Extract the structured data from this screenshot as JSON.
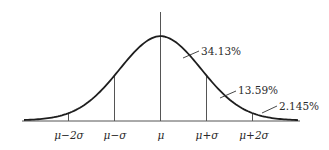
{
  "chart_data": {
    "type": "line",
    "title": "",
    "xlabel": "",
    "ylabel": "",
    "grid": false,
    "tick_labels": [
      "μ−2σ",
      "μ−σ",
      "μ",
      "μ+σ",
      "μ+2σ"
    ],
    "tick_positions_sigma": [
      -2,
      -1,
      0,
      1,
      2
    ],
    "annotations": [
      {
        "text": "34.13%",
        "region": "μ to μ+σ"
      },
      {
        "text": "13.59%",
        "region": "μ+σ to μ+2σ"
      },
      {
        "text": "2.145%",
        "region": "beyond μ+2σ"
      }
    ],
    "series": [
      {
        "name": "normal density",
        "x_sigma": [
          -3,
          -2.5,
          -2,
          -1.5,
          -1,
          -0.5,
          0,
          0.5,
          1,
          1.5,
          2,
          2.5,
          3
        ],
        "y_relative": [
          0.04,
          0.08,
          0.15,
          0.27,
          0.45,
          0.8,
          1.0,
          0.8,
          0.45,
          0.27,
          0.15,
          0.08,
          0.04
        ]
      }
    ]
  },
  "labels": {
    "ticks": [
      {
        "pre": "μ",
        "op": "−",
        "post": "2σ"
      },
      {
        "pre": "μ",
        "op": "−",
        "post": "σ"
      },
      {
        "pre": "μ",
        "op": "",
        "post": ""
      },
      {
        "pre": "μ",
        "op": "+",
        "post": "σ"
      },
      {
        "pre": "μ",
        "op": "+",
        "post": "2σ"
      }
    ],
    "pct_1": "34.13%",
    "pct_2": "13.59%",
    "pct_3": "2.145%"
  },
  "colors": {
    "line": "#1e1e1e",
    "guide": "#5a5a5a"
  }
}
